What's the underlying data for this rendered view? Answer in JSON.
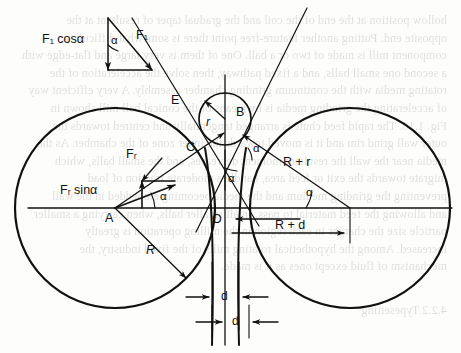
{
  "figure": {
    "type": "geometry-force-diagram",
    "background_color": "#fdfdfb",
    "line_color": "#111111"
  },
  "labels": {
    "f1_cos_alpha": "F₁ cosα",
    "f1": "F₁",
    "fr": "Fᵣ",
    "fr_sin_alpha": "Fᵣ sinα",
    "alpha_top": "α",
    "alpha_left": "α",
    "alpha_center": "α",
    "alpha_right": "α",
    "alpha_c": "α",
    "point_a": "A",
    "point_b": "B",
    "point_c": "C",
    "point_e": "E",
    "point_o": "O",
    "radius_r_small": "r",
    "radius_r_big": "R",
    "r_plus_r": "R + r",
    "r_plus_d": "R + d",
    "d_upper": "d",
    "d_lower": "d"
  },
  "geometry": {
    "left_circle": {
      "cx": 115,
      "cy": 208,
      "r": 100,
      "center_label": "A"
    },
    "right_circle": {
      "cx": 350,
      "cy": 208,
      "r": 100
    },
    "small_circle": {
      "cx": 225,
      "cy": 119,
      "r": 26,
      "center_label": "B"
    },
    "origin": {
      "x": 225,
      "y": 208,
      "label": "O"
    },
    "contact_point_c": {
      "x": 205,
      "y": 150,
      "label": "C"
    },
    "point_e": {
      "x": 180,
      "y": 103,
      "label": "E"
    },
    "axis_y": 208,
    "axis_x_start": 28,
    "axis_x_end": 452,
    "vertical_axis_x": 225,
    "vertical_axis_top": 75,
    "vertical_axis_bottom": 345
  },
  "bleed_text": {
    "lines": [
      "hollow position at the end of the coil and the gradual taper of resultant at the",
      "opposite end. Putting another feature-free point there is somewhat difficult: a",
      "component mill is made of two or a ball. One of them is very large and flat-edge with",
      "a second one small balls, and a fixed pathway, then solve the acceleration of the",
      "rotating media with the continuum grinding chamber assembly. A very efficient way",
      "of accelerating the grinding media is by means of the conical ball mill shown in",
      "Fig. 1.16. The rapid feed chute is arranged tangentially and centred towards the",
      "outer wall grind rim and it is moved towards the inner zone of the chamber. As the",
      "media near the wall the resultant moment decreases, and the small balls, which",
      "migrate towards the exit or feed area, handle a moderate fraction of load",
      "preventing the grinding medium and the media becoming embedded in the wall",
      "and allowing the feed material to pass. In all smaller balls, when carrying a smaller",
      "particle size the charges in each region in the milling operation is greatly",
      "increased. Among the hypothetical rotating mills of the fixed industry, the",
      "mechanism of fluid except ones as it is made."
    ],
    "footer": "4.2.2  Typesetting"
  }
}
